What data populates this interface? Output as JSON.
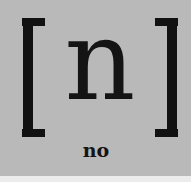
{
  "card": {
    "symbol": "n",
    "word": "no",
    "left_bracket": "[",
    "right_bracket": "]",
    "colors": {
      "background": "#b9b9b9",
      "ink": "#111111"
    }
  }
}
